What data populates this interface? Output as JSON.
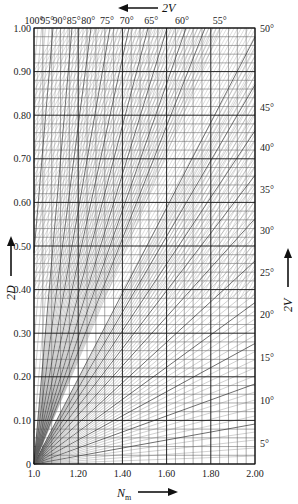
{
  "chart_data": {
    "type": "nomogram",
    "title": "",
    "xlabel": "N_m",
    "xlabel_main": "N",
    "xlabel_sub": "m",
    "ylabel_left": "2D",
    "ylabel_right": "2V",
    "top_label": "2V",
    "xlim": [
      1.0,
      2.0
    ],
    "ylim": [
      0,
      1.0
    ],
    "x_ticks": [
      "1.0",
      "1.20",
      "1.40",
      "1.60",
      "1.80",
      "2.00"
    ],
    "x_tick_values": [
      1.0,
      1.2,
      1.4,
      1.6,
      1.8,
      2.0
    ],
    "y_ticks": [
      "0",
      "0.10",
      "0.20",
      "0.30",
      "0.40",
      "0.50",
      "0.60",
      "0.70",
      "0.80",
      "0.90",
      "1.00"
    ],
    "y_tick_values": [
      0,
      0.1,
      0.2,
      0.3,
      0.4,
      0.5,
      0.6,
      0.7,
      0.8,
      0.9,
      1.0
    ],
    "right_ticks": [
      "5°",
      "10°",
      "15°",
      "20°",
      "25°",
      "30°",
      "35°",
      "40°",
      "45°",
      "50°"
    ],
    "right_tick_y_values": [
      0.047,
      0.146,
      0.245,
      0.344,
      0.44,
      0.535,
      0.63,
      0.725,
      0.818,
      1.0
    ],
    "top_ticks": [
      "100°",
      "95°",
      "90°",
      "85°",
      "80°",
      "75°",
      "70°",
      "65°",
      "60°",
      "55°"
    ],
    "top_tick_x_values": [
      1.0,
      1.06,
      1.115,
      1.18,
      1.245,
      1.33,
      1.42,
      1.53,
      1.67,
      1.84
    ],
    "grid": {
      "major_x_step": 0.2,
      "minor_x_step": 0.04,
      "major_y_step": 0.1,
      "minor_y_step": 0.02,
      "on": true
    },
    "curve_family": "lines of constant 2V (optic angle) relating 2D and N_m",
    "legend": null
  }
}
